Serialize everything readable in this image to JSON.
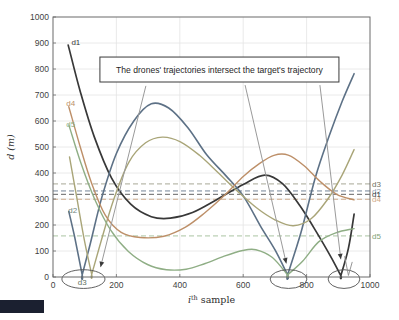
{
  "figure": {
    "background": "#ffffff",
    "corner_artifact_color": "#1b2030",
    "axis_color": "#6b6b6b",
    "grid_color": "#e4e4e4",
    "tick_label_color": "#3f3f3f",
    "annotation": {
      "text": "The drones' trajectories intersect the target's trajectory",
      "x1": 148,
      "y1": 750,
      "x2": 902,
      "y2": 846,
      "border_color": "#3a3a3a",
      "fill": "#ffffff",
      "text_color": "#1f1f1f"
    }
  },
  "chart_data": {
    "type": "line",
    "title": "",
    "xlabel": "i^th sample",
    "xlabel_parts": {
      "base": "i",
      "sup": "th",
      "rest": " sample"
    },
    "ylabel": "d (m)",
    "xlim": [
      0,
      1000
    ],
    "ylim": [
      0,
      1000
    ],
    "xticks": [
      0,
      200,
      400,
      600,
      800,
      1000
    ],
    "yticks": [
      0,
      100,
      200,
      300,
      400,
      500,
      600,
      700,
      800,
      900,
      1000
    ],
    "grid": true,
    "legend_position": "none",
    "series": [
      {
        "name": "d1",
        "color": "#383838",
        "width": 1.7,
        "points": [
          [
            48,
            892
          ],
          [
            85,
            718
          ],
          [
            130,
            540
          ],
          [
            185,
            380
          ],
          [
            245,
            280
          ],
          [
            310,
            232
          ],
          [
            370,
            226
          ],
          [
            440,
            248
          ],
          [
            520,
            300
          ],
          [
            600,
            356
          ],
          [
            668,
            392
          ],
          [
            725,
            358
          ],
          [
            780,
            272
          ],
          [
            835,
            165
          ],
          [
            880,
            70
          ],
          [
            908,
            5
          ],
          [
            908,
            5
          ],
          [
            932,
            110
          ],
          [
            950,
            242
          ]
        ]
      },
      {
        "name": "d2",
        "color": "#5d7186",
        "width": 1.6,
        "points": [
          [
            50,
            252
          ],
          [
            68,
            155
          ],
          [
            92,
            8
          ],
          [
            92,
            8
          ],
          [
            118,
            130
          ],
          [
            155,
            310
          ],
          [
            200,
            475
          ],
          [
            255,
            600
          ],
          [
            310,
            666
          ],
          [
            365,
            650
          ],
          [
            425,
            575
          ],
          [
            485,
            470
          ],
          [
            545,
            390
          ],
          [
            600,
            312
          ],
          [
            655,
            195
          ],
          [
            700,
            105
          ],
          [
            740,
            8
          ],
          [
            740,
            8
          ],
          [
            782,
            170
          ],
          [
            828,
            385
          ],
          [
            872,
            545
          ],
          [
            912,
            675
          ],
          [
            950,
            782
          ]
        ]
      },
      {
        "name": "d3",
        "color": "#a9a578",
        "width": 1.4,
        "points": [
          [
            52,
            462
          ],
          [
            75,
            305
          ],
          [
            100,
            135
          ],
          [
            122,
            10
          ],
          [
            122,
            10
          ],
          [
            150,
            130
          ],
          [
            192,
            300
          ],
          [
            240,
            443
          ],
          [
            292,
            516
          ],
          [
            345,
            538
          ],
          [
            402,
            520
          ],
          [
            462,
            468
          ],
          [
            522,
            400
          ],
          [
            582,
            330
          ],
          [
            642,
            266
          ],
          [
            700,
            220
          ],
          [
            758,
            197
          ],
          [
            815,
            225
          ],
          [
            868,
            302
          ],
          [
            912,
            392
          ],
          [
            950,
            490
          ]
        ]
      },
      {
        "name": "d4",
        "color": "#bd8f68",
        "width": 1.4,
        "points": [
          [
            50,
            655
          ],
          [
            85,
            505
          ],
          [
            122,
            360
          ],
          [
            165,
            238
          ],
          [
            215,
            172
          ],
          [
            275,
            152
          ],
          [
            350,
            157
          ],
          [
            418,
            192
          ],
          [
            480,
            248
          ],
          [
            542,
            315
          ],
          [
            602,
            388
          ],
          [
            652,
            437
          ],
          [
            697,
            468
          ],
          [
            742,
            469
          ],
          [
            792,
            428
          ],
          [
            842,
            368
          ],
          [
            895,
            318
          ],
          [
            950,
            297
          ]
        ]
      },
      {
        "name": "d5",
        "color": "#8fae85",
        "width": 1.4,
        "points": [
          [
            50,
            585
          ],
          [
            88,
            438
          ],
          [
            132,
            298
          ],
          [
            182,
            180
          ],
          [
            238,
            98
          ],
          [
            298,
            48
          ],
          [
            358,
            28
          ],
          [
            420,
            30
          ],
          [
            480,
            52
          ],
          [
            540,
            80
          ],
          [
            598,
            102
          ],
          [
            640,
            105
          ],
          [
            692,
            75
          ],
          [
            740,
            8
          ],
          [
            740,
            8
          ],
          [
            788,
            62
          ],
          [
            838,
            135
          ],
          [
            892,
            170
          ],
          [
            950,
            186
          ]
        ]
      }
    ],
    "thresholds": [
      {
        "name": "d3",
        "value": 358,
        "color": "#9a9a86"
      },
      {
        "name": "d2",
        "value": 331,
        "color": "#5d7186"
      },
      {
        "name": "d1",
        "value": 318,
        "color": "#4a4a4a"
      },
      {
        "name": "d4",
        "value": 299,
        "color": "#c9a07c"
      },
      {
        "name": "d5",
        "value": 158,
        "color": "#9dbb93"
      }
    ],
    "threshold_labels": [
      {
        "text": "d3",
        "value": 358,
        "color": "#6f6f60"
      },
      {
        "text": "d2",
        "value": 331,
        "color": "#8fa0b2"
      },
      {
        "text": "d1",
        "value": 318,
        "color": "#3f3f3f"
      },
      {
        "text": "d4",
        "value": 299,
        "color": "#cfa985"
      },
      {
        "text": "d5",
        "value": 158,
        "color": "#7fa275"
      }
    ],
    "curve_labels": [
      {
        "text": "d1",
        "x": 58,
        "y": 905,
        "color": "#383838"
      },
      {
        "text": "d4",
        "x": 42,
        "y": 668,
        "color": "#bd8f68"
      },
      {
        "text": "d5",
        "x": 42,
        "y": 588,
        "color": "#8fae85"
      },
      {
        "text": "d2",
        "x": 48,
        "y": 258,
        "color": "#74857c"
      },
      {
        "text": "d3",
        "x": 78,
        "y": -20,
        "color": "#5f7260"
      }
    ],
    "ellipses": [
      {
        "cx": 96,
        "cy": -8,
        "rx": 68,
        "ry": 36,
        "color": "#4f4f4f"
      },
      {
        "cx": 743,
        "cy": -8,
        "rx": 58,
        "ry": 36,
        "color": "#4f4f4f"
      },
      {
        "cx": 918,
        "cy": -8,
        "rx": 50,
        "ry": 36,
        "color": "#4f4f4f"
      }
    ],
    "arrows": [
      {
        "x1": 293,
        "y1": 735,
        "x2": 150,
        "y2": 38
      },
      {
        "x1": 606,
        "y1": 738,
        "x2": 736,
        "y2": 52
      },
      {
        "x1": 842,
        "y1": 738,
        "x2": 908,
        "y2": 68
      }
    ],
    "v_marks": [
      {
        "pts": [
          [
            920,
            80
          ],
          [
            932,
            6
          ],
          [
            944,
            58
          ]
        ]
      }
    ],
    "arrow_line_color": "#9a9a9a",
    "arrow_head_color": "#3a3a3a"
  }
}
